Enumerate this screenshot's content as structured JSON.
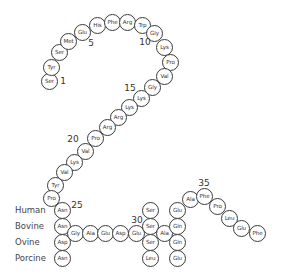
{
  "diagram": {
    "type": "amino acid sequence (peptide chain with species variants)",
    "residues": [
      {
        "pos": 1,
        "label": "Ser",
        "x": 49,
        "y": 81
      },
      {
        "pos": 2,
        "label": "Tyr",
        "x": 51,
        "y": 67
      },
      {
        "pos": 3,
        "label": "Ser",
        "x": 59,
        "y": 52
      },
      {
        "pos": 4,
        "label": "Met",
        "x": 68,
        "y": 41
      },
      {
        "pos": 5,
        "label": "Glu",
        "x": 82,
        "y": 32
      },
      {
        "pos": 6,
        "label": "His",
        "x": 97,
        "y": 25
      },
      {
        "pos": 7,
        "label": "Phe",
        "x": 112,
        "y": 22
      },
      {
        "pos": 8,
        "label": "Arg",
        "x": 127,
        "y": 22
      },
      {
        "pos": 9,
        "label": "Trp",
        "x": 142,
        "y": 25
      },
      {
        "pos": 10,
        "label": "Gly",
        "x": 154,
        "y": 33
      },
      {
        "pos": 11,
        "label": "Lys",
        "x": 164,
        "y": 47
      },
      {
        "pos": 12,
        "label": "Pro",
        "x": 170,
        "y": 62
      },
      {
        "pos": 13,
        "label": "Val",
        "x": 164,
        "y": 76
      },
      {
        "pos": 14,
        "label": "Gly",
        "x": 152,
        "y": 87
      },
      {
        "pos": 15,
        "label": "Lys",
        "x": 141,
        "y": 98
      },
      {
        "pos": 16,
        "label": "Lys",
        "x": 129,
        "y": 107
      },
      {
        "pos": 17,
        "label": "Arg",
        "x": 118,
        "y": 117
      },
      {
        "pos": 18,
        "label": "Arg",
        "x": 107,
        "y": 127
      },
      {
        "pos": 19,
        "label": "Pro",
        "x": 95,
        "y": 138
      },
      {
        "pos": 20,
        "label": "Val",
        "x": 85,
        "y": 151
      },
      {
        "pos": 21,
        "label": "Lys",
        "x": 74,
        "y": 162
      },
      {
        "pos": 22,
        "label": "Val",
        "x": 64,
        "y": 172
      },
      {
        "pos": 23,
        "label": "Tyr",
        "x": 55,
        "y": 185
      },
      {
        "pos": 24,
        "label": "Pro",
        "x": 51,
        "y": 198
      },
      {
        "pos": 25,
        "label": "Asn",
        "x": 62,
        "y": 210,
        "species": "Human"
      },
      {
        "pos": 25,
        "label": "Asn",
        "x": 62,
        "y": 226,
        "species": "Bovine"
      },
      {
        "pos": 25,
        "label": "Asp",
        "x": 62,
        "y": 242,
        "species": "Ovine"
      },
      {
        "pos": 25,
        "label": "Asn",
        "x": 62,
        "y": 258,
        "species": "Porcine"
      },
      {
        "pos": 26,
        "label": "Gly",
        "x": 75,
        "y": 233
      },
      {
        "pos": 27,
        "label": "Ala",
        "x": 90,
        "y": 233
      },
      {
        "pos": 28,
        "label": "Glu",
        "x": 105,
        "y": 233
      },
      {
        "pos": 29,
        "label": "Asp",
        "x": 120,
        "y": 233
      },
      {
        "pos": 30,
        "label": "Glu",
        "x": 136,
        "y": 233
      },
      {
        "pos": 31,
        "label": "Ser",
        "x": 150,
        "y": 210,
        "species": "Human"
      },
      {
        "pos": 31,
        "label": "Ser",
        "x": 150,
        "y": 226,
        "species": "Bovine"
      },
      {
        "pos": 31,
        "label": "Ser",
        "x": 150,
        "y": 242,
        "species": "Ovine"
      },
      {
        "pos": 31,
        "label": "Leu",
        "x": 150,
        "y": 258,
        "species": "Porcine"
      },
      {
        "pos": 32,
        "label": "Ala",
        "x": 164,
        "y": 233
      },
      {
        "pos": 33,
        "label": "Glu",
        "x": 177,
        "y": 210,
        "species": "Human"
      },
      {
        "pos": 33,
        "label": "Gln",
        "x": 177,
        "y": 226,
        "species": "Bovine"
      },
      {
        "pos": 33,
        "label": "Gln",
        "x": 177,
        "y": 242,
        "species": "Ovine"
      },
      {
        "pos": 33,
        "label": "Glu",
        "x": 177,
        "y": 258,
        "species": "Porcine"
      },
      {
        "pos": 34,
        "label": "Ala",
        "x": 190,
        "y": 199
      },
      {
        "pos": 35,
        "label": "Phe",
        "x": 204,
        "y": 196
      },
      {
        "pos": 36,
        "label": "Pro",
        "x": 217,
        "y": 206
      },
      {
        "pos": 37,
        "label": "Leu",
        "x": 229,
        "y": 218
      },
      {
        "pos": 38,
        "label": "Glu",
        "x": 241,
        "y": 228
      },
      {
        "pos": 39,
        "label": "Phe",
        "x": 257,
        "y": 233
      }
    ],
    "position_markers": [
      {
        "label": "1",
        "x": 63,
        "y": 81
      },
      {
        "label": "5",
        "x": 91,
        "y": 43
      },
      {
        "label": "10",
        "x": 145,
        "y": 42
      },
      {
        "label": "15",
        "x": 130,
        "y": 88
      },
      {
        "label": "20",
        "x": 73,
        "y": 139
      },
      {
        "label": "25",
        "x": 77,
        "y": 205
      },
      {
        "label": "30",
        "x": 137,
        "y": 220
      },
      {
        "label": "35",
        "x": 204,
        "y": 183
      }
    ],
    "species_labels": [
      {
        "label": "Human",
        "x": 15,
        "y": 210
      },
      {
        "label": "Bovine",
        "x": 15,
        "y": 226
      },
      {
        "label": "Ovine",
        "x": 15,
        "y": 242
      },
      {
        "label": "Porcine",
        "x": 15,
        "y": 258
      }
    ]
  }
}
